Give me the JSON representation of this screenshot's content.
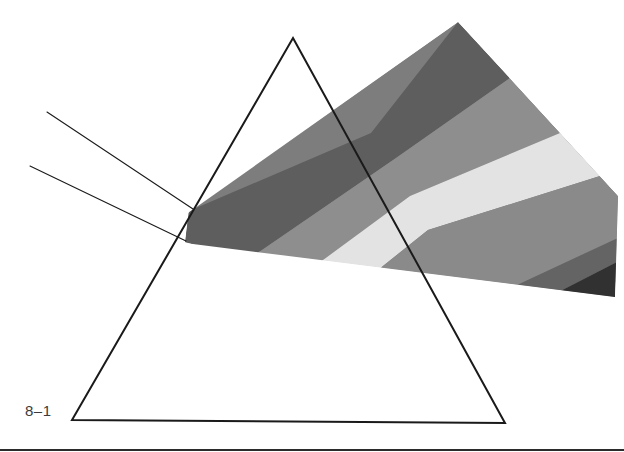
{
  "figure": {
    "label": "8–1",
    "caption_text": "8–1",
    "background_color": "#ffffff",
    "stroke_color": "#1a1a1a",
    "label_color": "#3b3b3b",
    "rule_color": "#2b2b2b",
    "width": 624,
    "height": 452
  },
  "prism": {
    "name": "triangular-prism",
    "apex": [
      293,
      38
    ],
    "base_left": [
      72,
      420
    ],
    "base_right": [
      505,
      423
    ],
    "stroke_width": 2.0,
    "fill": "none",
    "outline_points": "293,38 505,423 72,420"
  },
  "incident_rays": [
    {
      "name": "upper-incident-ray",
      "from": [
        47,
        112
      ],
      "to": [
        193,
        209
      ],
      "stroke_width": 1.1
    },
    {
      "name": "lower-incident-ray",
      "from": [
        30,
        166
      ],
      "to": [
        186,
        241
      ],
      "stroke_width": 1.1
    }
  ],
  "spectrum": {
    "name": "dispersed-spectrum-fan",
    "origin_vertex": [
      188,
      213
    ],
    "top_apex": [
      458,
      22
    ],
    "right_top": [
      618,
      196
    ],
    "right_bottom": [
      615,
      297
    ],
    "bottom_vertex": [
      185,
      243
    ],
    "kink_x": 388,
    "band_count": 7,
    "bands": [
      {
        "index": 0,
        "name": "band-outer-upper-dark",
        "color": "#5e5e5e",
        "points": "189,211 371,133 458,22 510,78 396,158 246,261 185,242"
      },
      {
        "index": 1,
        "name": "band-upper-mid-gray",
        "color": "#8e8e8e",
        "points": "510,78 560,133 410,196 270,299 246,261 396,158"
      },
      {
        "index": 2,
        "name": "band-highlight-light",
        "color": "#e3e3e3",
        "points": "560,133 600,176 428,230 298,334 270,299 410,196"
      },
      {
        "index": 3,
        "name": "band-lower-mid-gray",
        "color": "#8a8a8a",
        "points": "600,176 618,196 618,238 330,372 298,334 428,230"
      },
      {
        "index": 4,
        "name": "band-lower-dark-gray",
        "color": "#646464",
        "points": "618,238 617,262 352,398 330,372"
      },
      {
        "index": 5,
        "name": "band-edge-near-black",
        "color": "#313131",
        "points": "617,262 615,297 352,398"
      }
    ],
    "underlay": {
      "name": "spectrum-body-underlay",
      "color": "#7d7d7d",
      "points": "189,211 458,22 618,196 615,297 185,242"
    }
  },
  "palette": {
    "darkest": "#313131",
    "dark": "#4a4a4a",
    "mid_dark": "#5e5e5e",
    "mid": "#7d7d7d",
    "mid_light": "#8e8e8e",
    "light": "#c9c9c9",
    "lightest": "#e3e3e3"
  }
}
